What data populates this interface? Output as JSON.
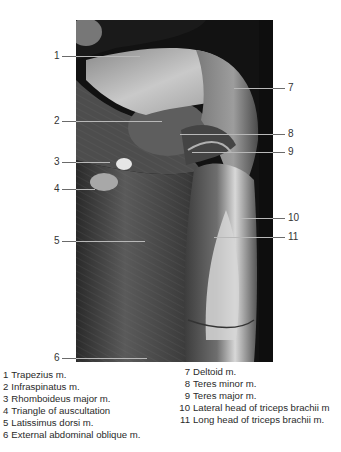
{
  "figure": {
    "labels": [
      {
        "num": "1",
        "side": "left",
        "y": 56
      },
      {
        "num": "2",
        "side": "left",
        "y": 121
      },
      {
        "num": "3",
        "side": "left",
        "y": 162
      },
      {
        "num": "4",
        "side": "left",
        "y": 189
      },
      {
        "num": "5",
        "side": "left",
        "y": 241
      },
      {
        "num": "6",
        "side": "left",
        "y": 358
      },
      {
        "num": "7",
        "side": "right",
        "y": 88
      },
      {
        "num": "8",
        "side": "right",
        "y": 134
      },
      {
        "num": "9",
        "side": "right",
        "y": 152
      },
      {
        "num": "10",
        "side": "right",
        "y": 218
      },
      {
        "num": "11",
        "side": "right",
        "y": 237
      }
    ]
  },
  "legend": {
    "left": [
      {
        "num": "1",
        "text": "Trapezius m."
      },
      {
        "num": "2",
        "text": "Infraspinatus m."
      },
      {
        "num": "3",
        "text": "Rhomboideus major m."
      },
      {
        "num": "4",
        "text": "Triangle of auscultation"
      },
      {
        "num": "5",
        "text": "Latissimus dorsi m."
      },
      {
        "num": "6",
        "text": "External abdominal oblique m."
      }
    ],
    "right": [
      {
        "num": "7",
        "text": "Deltoid m."
      },
      {
        "num": "8",
        "text": "Teres minor m."
      },
      {
        "num": "9",
        "text": "Teres major m."
      },
      {
        "num": "10",
        "text": "Lateral head of triceps brachii m"
      },
      {
        "num": "11",
        "text": "Long head of triceps brachii m."
      }
    ]
  }
}
